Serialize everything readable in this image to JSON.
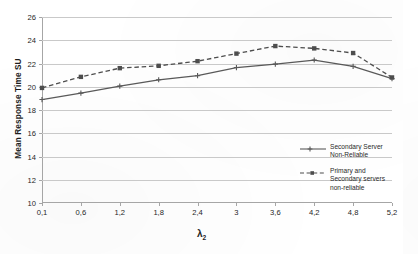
{
  "chart_data": {
    "type": "line",
    "title": "",
    "xlabel": "λ₂",
    "ylabel": "Mean Response Time SU",
    "categories": [
      "0,1",
      "0,6",
      "1,2",
      "1,8",
      "2,4",
      "3",
      "3,6",
      "4,2",
      "4,8",
      "5,2"
    ],
    "ylim": [
      10,
      26
    ],
    "yticks": [
      10,
      12,
      14,
      16,
      18,
      20,
      22,
      24,
      26
    ],
    "grid": true,
    "legend_position": "inside-right",
    "series": [
      {
        "name": "Secondary Server Non-Reliable",
        "label_line1": "Secondary Server",
        "label_line2": "Non-Reliable",
        "line_style": "solid",
        "marker": "cross",
        "color": "#595959",
        "values": [
          18.9,
          19.45,
          20.05,
          20.6,
          20.95,
          21.65,
          21.95,
          22.3,
          21.75,
          20.7
        ]
      },
      {
        "name": "Primary and Secondary servers non-reliable",
        "label_line1": "Primary and",
        "label_line2": "Secondary servers",
        "label_line3": "non-reliable",
        "line_style": "dashed",
        "marker": "square",
        "color": "#4d4d4d",
        "values": [
          19.9,
          20.85,
          21.6,
          21.8,
          22.2,
          22.85,
          23.5,
          23.3,
          22.9,
          20.8
        ]
      }
    ]
  },
  "axis": {
    "y_title": "Mean Response Time SU",
    "x_title_base": "λ",
    "x_title_sub": "2"
  }
}
